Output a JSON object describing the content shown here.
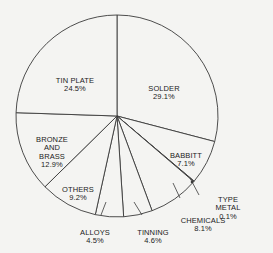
{
  "chart_data": {
    "type": "pie",
    "title": "",
    "start_angle": "12 o'clock",
    "direction": "clockwise",
    "categories": [
      "SOLDER",
      "BABBITT",
      "TYPE METAL",
      "CHEMICALS",
      "TINNING",
      "ALLOYS",
      "OTHERS",
      "BRONZE AND BRASS",
      "TIN PLATE"
    ],
    "values": [
      29.1,
      7.1,
      0.1,
      8.1,
      4.6,
      4.5,
      9.2,
      12.9,
      24.5
    ],
    "unit": "%",
    "slices": [
      {
        "label": "SOLDER",
        "value_label": "29.1%",
        "value": 29.1
      },
      {
        "label": "BABBITT",
        "value_label": "7.1%",
        "value": 7.1
      },
      {
        "label": "TYPE METAL",
        "value_label": "0.1%",
        "value": 0.1
      },
      {
        "label": "CHEMICALS",
        "value_label": "8.1%",
        "value": 8.1
      },
      {
        "label": "TINNING",
        "value_label": "4.6%",
        "value": 4.6
      },
      {
        "label": "ALLOYS",
        "value_label": "4.5%",
        "value": 4.5
      },
      {
        "label": "OTHERS",
        "value_label": "9.2%",
        "value": 9.2
      },
      {
        "label": "BRONZE\nAND\nBRASS",
        "value_label": "12.9%",
        "value": 12.9
      },
      {
        "label": "TIN PLATE",
        "value_label": "24.5%",
        "value": 24.5
      }
    ],
    "legend": "none (labels placed on/near slices)"
  },
  "style": {
    "line_color": "#3a3a3a",
    "fill_color": "#f4f4f2"
  },
  "labels": [
    {
      "id": "solder",
      "text": "SOLDER",
      "pct": "29.1%",
      "x": 164,
      "y": 76
    },
    {
      "id": "babbitt",
      "text": "BABBITT",
      "pct": "7.1%",
      "x": 186,
      "y": 143
    },
    {
      "id": "type-metal",
      "text": "TYPE METAL",
      "pct": "0.1%",
      "x": 228,
      "y": 187
    },
    {
      "id": "chemicals",
      "text": "CHEMICALS",
      "pct": "8.1%",
      "x": 203,
      "y": 208
    },
    {
      "id": "tinning",
      "text": "TINNING",
      "pct": "4.6%",
      "x": 153,
      "y": 220
    },
    {
      "id": "alloys",
      "text": "ALLOYS",
      "pct": "4.5%",
      "x": 95,
      "y": 220
    },
    {
      "id": "others",
      "text": "OTHERS",
      "pct": "9.2%",
      "x": 78,
      "y": 177
    },
    {
      "id": "bronze",
      "text": "BRONZE\nAND\nBRASS",
      "pct": "12.9%",
      "x": 52,
      "y": 127
    },
    {
      "id": "tin-plate",
      "text": "TIN PLATE",
      "pct": "24.5%",
      "x": 75,
      "y": 68
    }
  ],
  "geometry": {
    "cx": 117,
    "cy": 116,
    "r": 101
  }
}
